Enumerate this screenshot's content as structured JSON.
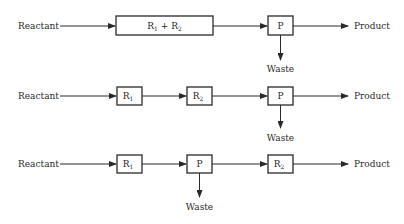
{
  "diagram": {
    "rows": [
      {
        "id": "row-1",
        "input_label": "Reactant",
        "output_label": "Product",
        "waste_label": "Waste",
        "boxes": [
          {
            "id": "r1r2",
            "label": "R",
            "sub1": "1",
            "plus": " + ",
            "label2": "R",
            "sub2": "2"
          },
          {
            "id": "p",
            "label": "P"
          }
        ],
        "sequence": [
          "R1 + R2",
          "P"
        ],
        "waste_from": "P"
      },
      {
        "id": "row-2",
        "input_label": "Reactant",
        "output_label": "Product",
        "waste_label": "Waste",
        "boxes": [
          {
            "id": "r1",
            "label": "R",
            "sub": "1"
          },
          {
            "id": "r2",
            "label": "R",
            "sub": "2"
          },
          {
            "id": "p",
            "label": "P"
          }
        ],
        "sequence": [
          "R1",
          "R2",
          "P"
        ],
        "waste_from": "P"
      },
      {
        "id": "row-3",
        "input_label": "Reactant",
        "output_label": "Product",
        "waste_label": "Waste",
        "boxes": [
          {
            "id": "r1",
            "label": "R",
            "sub": "1"
          },
          {
            "id": "p",
            "label": "P"
          },
          {
            "id": "r2",
            "label": "R",
            "sub": "2"
          }
        ],
        "sequence": [
          "R1",
          "P",
          "R2"
        ],
        "waste_from": "P"
      }
    ],
    "colors": {
      "stroke": "#2a2a2a",
      "background": "#ffffff"
    }
  }
}
